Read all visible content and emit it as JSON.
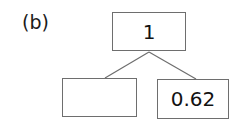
{
  "figure": {
    "panel_label": "(b)",
    "type": "tree-diagram",
    "background_color": "#ffffff",
    "box_border_color": "#6e6e6e",
    "connector_color": "#6e6e6e",
    "text_color": "#121212"
  },
  "nodes": {
    "root": {
      "name": "root-node",
      "value": "1"
    },
    "child_left": {
      "name": "left-child-node",
      "value": ""
    },
    "child_right": {
      "name": "right-child-node",
      "value": "0.62"
    }
  },
  "connectors": [
    {
      "name": "root-to-left-child",
      "from": [
        149,
        52
      ],
      "to": [
        105,
        78
      ]
    },
    {
      "name": "root-to-right-child",
      "from": [
        149,
        52
      ],
      "to": [
        196,
        79
      ]
    }
  ]
}
